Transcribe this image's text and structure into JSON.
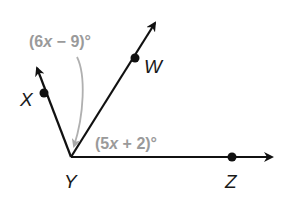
{
  "diagram": {
    "type": "angle-figure",
    "vertex": {
      "label": "Y"
    },
    "rays": [
      {
        "label": "X",
        "direction": "upper-left"
      },
      {
        "label": "W",
        "direction": "upper-right"
      },
      {
        "label": "Z",
        "direction": "right"
      }
    ],
    "angles": [
      {
        "name": "angle-XYW",
        "expression_prefix": "(6",
        "variable": "x",
        "expression_suffix": " − 9)°"
      },
      {
        "name": "angle-WYZ",
        "expression_prefix": "(5",
        "variable": "x",
        "expression_suffix": " + 2)°"
      }
    ],
    "colors": {
      "lines": "#111111",
      "annotation": "#9a9a9a",
      "background": "#ffffff"
    }
  }
}
